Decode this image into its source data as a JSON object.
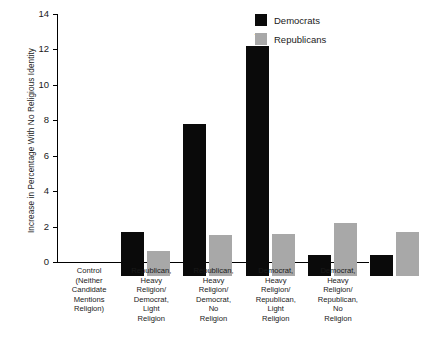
{
  "chart_data": {
    "type": "bar",
    "title": "",
    "xlabel": "",
    "ylabel": "Increase in Percentage With No Religious Identity",
    "ylim": [
      0,
      14
    ],
    "yticks": [
      0,
      2,
      4,
      6,
      8,
      10,
      12,
      14
    ],
    "ytick_labels": [
      "0",
      "2",
      "4",
      "6",
      "8",
      "10",
      "12",
      "14"
    ],
    "grid": false,
    "legend_position": "top-right",
    "categories": [
      "Control\n(Neither Candidate\nMentions\nReligion)",
      "Republican,\nHeavy\nReligion/\nDemocrat,\nLight\nReligion",
      "Republican,\nHeavy\nReligion/\nDemocrat,\nNo\nReligion",
      "Democrat,\nHeavy\nReligion/\nRepublican,\nLight\nReligion",
      "Democrat,\nHeavy\nReligion/\nRepublican,\nNo\nReligion"
    ],
    "series": [
      {
        "name": "Democrats",
        "color": "#0a0a0a",
        "values": [
          2.5,
          8.6,
          13.0,
          1.2,
          1.2
        ]
      },
      {
        "name": "Republicans",
        "color": "#a8a8a8",
        "values": [
          1.4,
          2.3,
          2.4,
          3.0,
          2.5
        ]
      }
    ],
    "annotations": [
      {
        "text": "*",
        "series": "Democrats",
        "category_index": 2,
        "value": 13.0
      }
    ]
  },
  "axis": {
    "y_title": "Increase in Percentage With No Religious Identity",
    "tick_labels": [
      "14",
      "12",
      "10",
      "8",
      "6",
      "4",
      "2",
      "0"
    ],
    "category_labels": [
      "Control\n(Neither Candidate\nMentions\nReligion)",
      "Republican,\nHeavy\nReligion/\nDemocrat,\nLight\nReligion",
      "Republican,\nHeavy\nReligion/\nDemocrat,\nNo\nReligion",
      "Democrat,\nHeavy\nReligion/\nRepublican,\nLight\nReligion",
      "Democrat,\nHeavy\nReligion/\nRepublican,\nNo\nReligion"
    ]
  },
  "legend": {
    "entries": [
      {
        "label": "Democrats",
        "color": "#0a0a0a"
      },
      {
        "label": "Republicans",
        "color": "#a8a8a8"
      }
    ]
  },
  "annotation": {
    "star": "*"
  }
}
